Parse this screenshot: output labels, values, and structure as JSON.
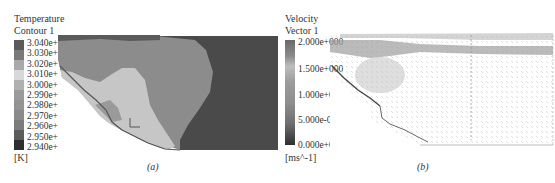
{
  "panel_a": {
    "legend_title_line1": "Temperature",
    "legend_title_line2": "Contour 1",
    "ticks": [
      "3.040e+002",
      "3.030e+002",
      "3.020e+002",
      "3.010e+002",
      "3.000e+002",
      "2.990e+002",
      "2.980e+002",
      "2.970e+002",
      "2.960e+002",
      "2.950e+002",
      "2.940e+002"
    ],
    "unit": "[K]",
    "caption": "(a)",
    "colors": {
      "band_top": "#5f5f5f",
      "band_upper": "#8e8e8e",
      "band_light": "#c7c7c7",
      "band_dark": "#4c4c4c"
    }
  },
  "panel_b": {
    "legend_title_line1": "Velocity",
    "legend_title_line2": "Vector 1",
    "ticks": [
      "2.000e+000",
      "1.500e+000",
      "1.000e+000",
      "5.000e-000",
      "0.000e+000"
    ],
    "unit": "[ms^-1]",
    "caption": "(b)"
  }
}
